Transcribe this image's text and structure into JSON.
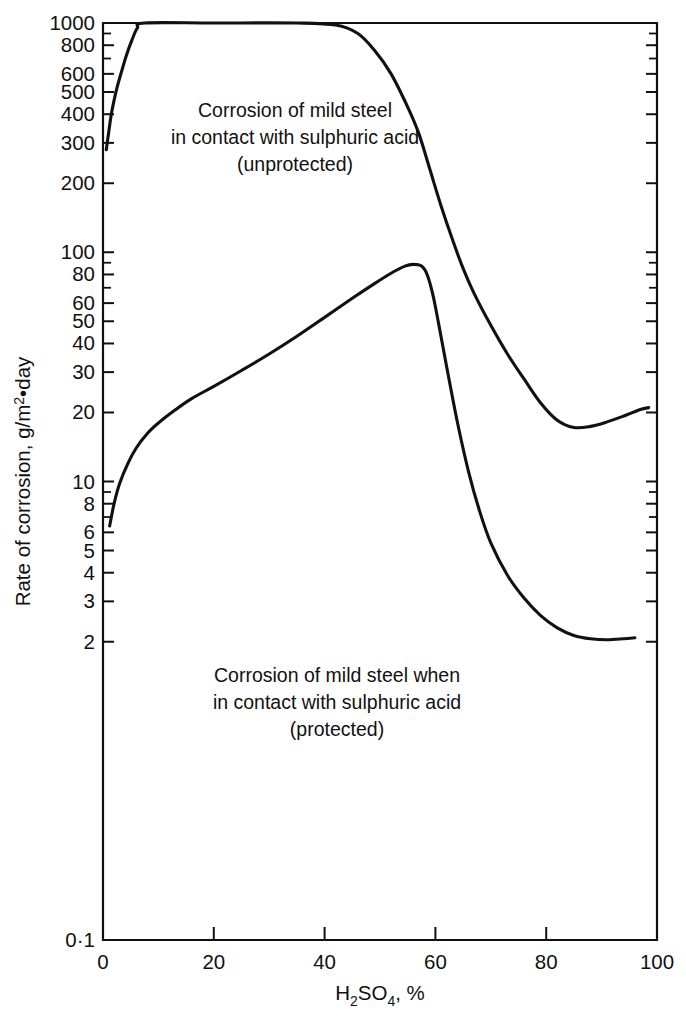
{
  "chart_data": {
    "type": "line",
    "title": "",
    "xlabel": "H₂SO₄, %",
    "ylabel": "Rate of corrosion, g/m²•day",
    "xlim": [
      0,
      100
    ],
    "ylim": [
      0.1,
      1000
    ],
    "yscale": "log",
    "xscale": "linear",
    "grid": false,
    "legend": "none",
    "x_ticks": [
      0,
      20,
      40,
      60,
      80,
      100
    ],
    "x_tick_labels": [
      "0",
      "20",
      "40",
      "60",
      "80",
      "100"
    ],
    "y_ticks": [
      0.1,
      2,
      3,
      4,
      5,
      6,
      8,
      10,
      20,
      30,
      40,
      50,
      60,
      80,
      100,
      200,
      300,
      400,
      500,
      600,
      800,
      1000
    ],
    "y_tick_labels": [
      "0·1",
      "2",
      "3",
      "4",
      "5",
      "6",
      "8",
      "10",
      "20",
      "30",
      "40",
      "50",
      "60",
      "80",
      "100",
      "200",
      "300",
      "400",
      "500",
      "600",
      "800",
      "1000"
    ],
    "y_minor_ticks": [
      7,
      9,
      70,
      90,
      700,
      900
    ],
    "series": [
      {
        "name": "unprotected",
        "annotation": "Corrosion of mild steel\nin contact with sulphuric acid\n(unprotected)",
        "points": [
          [
            0.6,
            280
          ],
          [
            1.0,
            330
          ],
          [
            1.5,
            400
          ],
          [
            2.0,
            460
          ],
          [
            2.6,
            530
          ],
          [
            3.4,
            620
          ],
          [
            4.2,
            720
          ],
          [
            5.2,
            840
          ],
          [
            6.2,
            950
          ],
          [
            7.5,
            1000
          ],
          [
            20,
            1000
          ],
          [
            35,
            1000
          ],
          [
            42,
            980
          ],
          [
            46,
            900
          ],
          [
            49,
            760
          ],
          [
            52,
            600
          ],
          [
            55,
            430
          ],
          [
            57,
            330
          ],
          [
            59,
            230
          ],
          [
            61,
            160
          ],
          [
            63,
            115
          ],
          [
            65,
            85
          ],
          [
            67,
            66
          ],
          [
            70,
            48
          ],
          [
            73,
            36
          ],
          [
            76,
            28
          ],
          [
            79,
            22
          ],
          [
            82,
            18.5
          ],
          [
            85,
            17.2
          ],
          [
            88,
            17.4
          ],
          [
            91,
            18.2
          ],
          [
            94,
            19.3
          ],
          [
            97,
            20.6
          ],
          [
            98.5,
            21.0
          ]
        ]
      },
      {
        "name": "protected",
        "annotation": "Corrosion of mild steel when\nin contact with sulphuric acid\n(protected)",
        "points": [
          [
            1.2,
            6.4
          ],
          [
            2.0,
            8.0
          ],
          [
            3.0,
            9.8
          ],
          [
            4.5,
            12.0
          ],
          [
            6.0,
            14.0
          ],
          [
            8.0,
            16.2
          ],
          [
            10.0,
            18.0
          ],
          [
            13.0,
            20.5
          ],
          [
            16.0,
            23.0
          ],
          [
            20.0,
            26.0
          ],
          [
            25.0,
            30.5
          ],
          [
            30.0,
            36.0
          ],
          [
            35.0,
            43.0
          ],
          [
            40.0,
            52.0
          ],
          [
            45.0,
            63.0
          ],
          [
            49.0,
            73.0
          ],
          [
            52.0,
            81.0
          ],
          [
            54.5,
            87.0
          ],
          [
            56.0,
            88.5
          ],
          [
            57.5,
            87.0
          ],
          [
            58.5,
            80.0
          ],
          [
            59.5,
            66.0
          ],
          [
            60.5,
            50.0
          ],
          [
            62.0,
            32.0
          ],
          [
            64.0,
            18.0
          ],
          [
            66.0,
            11.0
          ],
          [
            68.0,
            7.4
          ],
          [
            70.0,
            5.4
          ],
          [
            73.0,
            3.9
          ],
          [
            76.0,
            3.1
          ],
          [
            79.0,
            2.6
          ],
          [
            82.0,
            2.3
          ],
          [
            85.0,
            2.13
          ],
          [
            88.0,
            2.06
          ],
          [
            91.0,
            2.04
          ],
          [
            94.0,
            2.06
          ],
          [
            96.0,
            2.08
          ]
        ]
      }
    ],
    "annotations": [
      {
        "id": "unprotected-label",
        "lines": [
          "Corrosion of mild steel",
          "in contact with sulphuric acid",
          "(unprotected)"
        ],
        "x_px": 295,
        "y_px": 117
      },
      {
        "id": "protected-label",
        "lines": [
          "Corrosion of mild steel when",
          "in contact with sulphuric acid",
          "(protected)"
        ],
        "x_px": 337,
        "y_px": 682
      }
    ]
  }
}
